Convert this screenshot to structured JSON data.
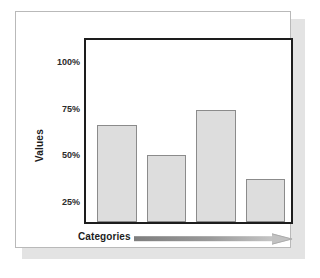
{
  "chart_data": {
    "type": "bar",
    "title": "",
    "subtitle": "",
    "xlabel": "Categories",
    "ylabel": "Values",
    "categories": [
      "",
      "",
      "",
      ""
    ],
    "values": [
      66,
      50,
      74,
      36
    ],
    "value_unit": "%",
    "ytick_labels": [
      "100%",
      "75%",
      "50%",
      "25%"
    ],
    "ytick_values": [
      100,
      75,
      50,
      25
    ],
    "ylim": [
      0,
      112
    ],
    "grid": false,
    "legend": null,
    "annotations": [],
    "series": [
      {
        "name": "Values",
        "values": [
          66,
          50,
          74,
          36
        ]
      }
    ],
    "colors": {
      "bar_fill": "#dddddd",
      "bar_stroke": "#8b8b8b",
      "frame_stroke": "#1d1d1d",
      "text": "#1d1d1d",
      "arrow": "#8a8a8a",
      "card_background": "#ffffff",
      "card_border": "#b9b9b9",
      "card_shadow": "#e3e3e3"
    }
  },
  "axis": {
    "y_title": "Values",
    "x_title": "Categories",
    "ticks": [
      {
        "label": "100%",
        "top": 45
      },
      {
        "label": "75%",
        "top": 92
      },
      {
        "label": "50%",
        "top": 138
      },
      {
        "label": "25%",
        "top": 185
      }
    ]
  },
  "bars": [
    {
      "name": "bar-1",
      "left": 11,
      "width": 40,
      "height": 97,
      "value": 66
    },
    {
      "name": "bar-2",
      "left": 61,
      "width": 39,
      "height": 67,
      "value": 50
    },
    {
      "name": "bar-3",
      "left": 110,
      "width": 40,
      "height": 112,
      "value": 74
    },
    {
      "name": "bar-4",
      "left": 160,
      "width": 39,
      "height": 43,
      "value": 36
    }
  ],
  "icons": {
    "x_axis_arrow": "right-arrow-icon"
  }
}
